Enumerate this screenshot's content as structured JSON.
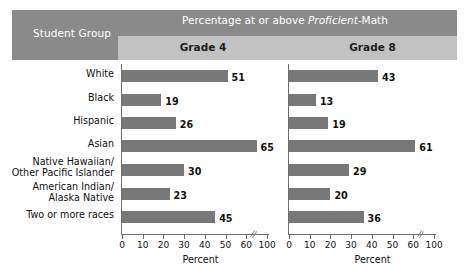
{
  "header": {
    "student_group_label": "Student Group",
    "percentage_title_pre": "Percentage at or above ",
    "percentage_title_italic": "Proficient",
    "percentage_title_post": "-Math",
    "percentage_title_full": "Percentage at or above Proficient-Math",
    "grade4_label": "Grade 4",
    "grade8_label": "Grade 8"
  },
  "axis": {
    "title": "Percent",
    "tick_labels": [
      "0",
      "10",
      "20",
      "30",
      "40",
      "50",
      "60",
      "100"
    ],
    "tick_values": [
      0,
      10,
      20,
      30,
      40,
      50,
      60,
      100
    ],
    "break_between": [
      60,
      100
    ],
    "break_glyph": "//"
  },
  "colors": {
    "header_band": "#8a8a8a",
    "subheader_band": "#c2c2c2",
    "bar": "#787878",
    "axis": "#6e6e6e",
    "header_text": "#ffffff",
    "body_text": "#111111",
    "background": "#ffffff"
  },
  "chart_data": {
    "type": "bar",
    "title": "Percentage at or above Proficient-Math",
    "orientation": "horizontal",
    "xlabel": "Percent",
    "ylabel": "Student Group",
    "xlim": [
      0,
      70
    ],
    "grid": false,
    "legend": "none",
    "categories": [
      "White",
      "Black",
      "Hispanic",
      "Asian",
      "Native Hawaiian/ Other Pacific Islander",
      "American Indian/ Alaska Native",
      "Two or more races"
    ],
    "category_lines": [
      [
        "White"
      ],
      [
        "Black"
      ],
      [
        "Hispanic"
      ],
      [
        "Asian"
      ],
      [
        "Native Hawaiian/",
        "Other Pacific Islander"
      ],
      [
        "American Indian/",
        "Alaska Native"
      ],
      [
        "Two or more races"
      ]
    ],
    "series": [
      {
        "name": "Grade 4",
        "values": [
          51,
          19,
          26,
          65,
          30,
          23,
          45
        ]
      },
      {
        "name": "Grade 8",
        "values": [
          43,
          13,
          19,
          61,
          29,
          20,
          36
        ]
      }
    ]
  }
}
